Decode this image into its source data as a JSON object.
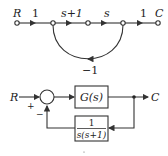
{
  "signal_flow_graph": {
    "input_label": "R",
    "output_label": "C",
    "branches": [
      {
        "from": 1,
        "to": 2,
        "gain": "1"
      },
      {
        "from": 2,
        "to": 3,
        "gain": "s+1"
      },
      {
        "from": 3,
        "to": 4,
        "gain": "s"
      },
      {
        "from": 4,
        "to": 5,
        "gain": "1"
      }
    ],
    "feedback": {
      "from": 4,
      "to": 2,
      "gain": "−1"
    }
  },
  "block_diagram": {
    "input_label": "R",
    "output_label": "C",
    "sum_signs": {
      "plus": "+",
      "minus": "−"
    },
    "forward_block": "G(s)",
    "feedback_block": {
      "numerator": "1",
      "denominator": "s(s+1)"
    }
  },
  "colors": {
    "line": "#333333",
    "background": "#ffffff"
  }
}
